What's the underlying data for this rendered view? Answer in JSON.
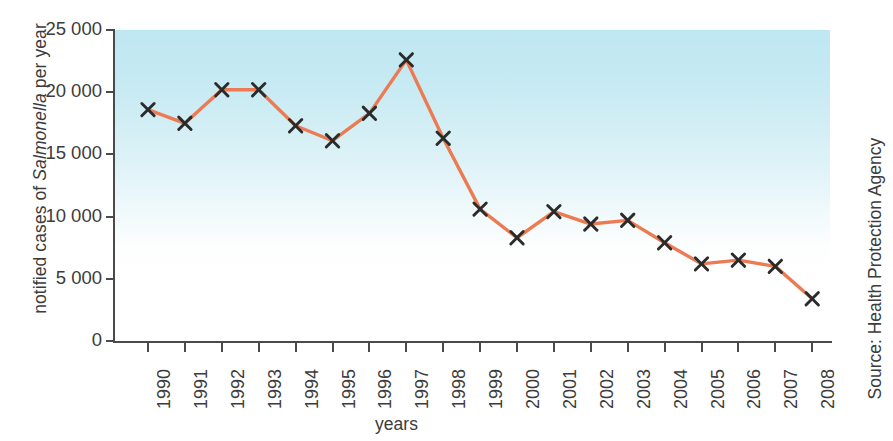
{
  "chart_data": {
    "type": "line",
    "title": "",
    "xlabel": "years",
    "ylabel": "notified cases of Salmonella per year",
    "ylabel_parts": {
      "prefix": "notified cases of ",
      "italic": "Salmonella",
      "suffix": " per year"
    },
    "categories": [
      "1990",
      "1991",
      "1992",
      "1993",
      "1994",
      "1995",
      "1996",
      "1997",
      "1998",
      "1999",
      "2000",
      "2001",
      "2002",
      "2003",
      "2004",
      "2005",
      "2006",
      "2007",
      "2008"
    ],
    "values": [
      18600,
      17500,
      20200,
      20200,
      17300,
      16100,
      18300,
      22600,
      16300,
      10600,
      8300,
      10400,
      9400,
      9700,
      7900,
      6200,
      6500,
      6000,
      3400
    ],
    "ytick_labels": [
      "25 000",
      "20 000",
      "15 000",
      "10 000",
      "5 000",
      "0"
    ],
    "ytick_values": [
      25000,
      20000,
      15000,
      10000,
      5000,
      0
    ],
    "ylim": [
      0,
      25000
    ],
    "grid": false,
    "legend": null,
    "marker": "x-cross",
    "line_color": "#ec7b53",
    "marker_color": "#2b2b2b",
    "plot_bg_top_color": "#bfe7f1",
    "plot_bg_bottom_color": "#ffffff",
    "axis_color": "#4a4a4a",
    "source": "Source: Health Protection Agency"
  },
  "annotations": {
    "source_note": "Source: Health Protection Agency",
    "x_axis_title": "years"
  }
}
